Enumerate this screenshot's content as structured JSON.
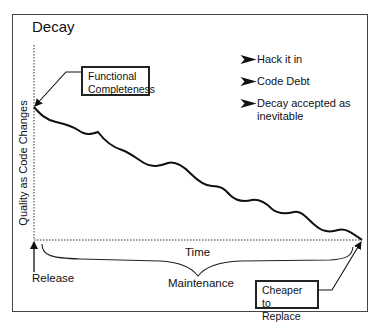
{
  "diagram": {
    "title": "Decay",
    "y_axis_label": "Quality as Code Changes",
    "x_axis_label": "Time",
    "callouts": {
      "start": "Functional Completeness",
      "start_lines": [
        "Functional",
        "Completeness"
      ],
      "end_lines": [
        "Cheaper",
        "to Replace"
      ]
    },
    "bullets": [
      {
        "icon": "arrowhead-bullet-icon",
        "label": "Hack it in"
      },
      {
        "icon": "arrowhead-bullet-icon",
        "label": "Code Debt"
      },
      {
        "icon": "arrowhead-bullet-icon",
        "label": "Decay accepted as inevitable"
      }
    ],
    "release_label": "Release",
    "maintenance_label": "Maintenance",
    "colors": {
      "line": "#111111",
      "frame": "#444444",
      "background": "#ffffff"
    }
  }
}
